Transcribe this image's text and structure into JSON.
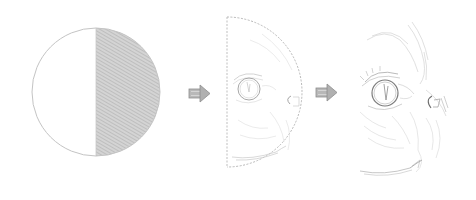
{
  "diagram": {
    "type": "process-sequence",
    "steps": [
      {
        "id": "step-1",
        "description": "circle with right half hatched",
        "shape": "circle"
      },
      {
        "id": "step-2",
        "description": "dashed half-circle containing faint cat face sketch",
        "shape": "half-circle"
      },
      {
        "id": "step-3",
        "description": "completed pencil sketch of cat face profile",
        "shape": "sketch"
      }
    ],
    "arrows": [
      {
        "from": "step-1",
        "to": "step-2",
        "icon": "right-arrow-icon"
      },
      {
        "from": "step-2",
        "to": "step-3",
        "icon": "right-arrow-icon"
      }
    ],
    "colors": {
      "outline": "#bdbdbd",
      "hatch_fill": "#cfcfcf",
      "hatch_line": "#a9a9a9",
      "arrow": "#9e9e9e",
      "sketch_line": "#b5b5b5",
      "sketch_dark": "#8a8a8a",
      "background": "#ffffff"
    }
  }
}
